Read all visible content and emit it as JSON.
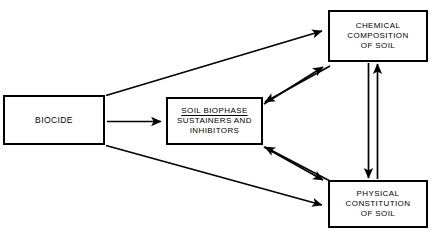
{
  "diagram": {
    "background_color": "#ffffff",
    "line_color": "#000000",
    "nodes": [
      {
        "id": "biocide",
        "label": "BIOCIDE",
        "lines": [
          "BIOCIDE"
        ],
        "underline_first_line": false
      },
      {
        "id": "soil-biophase",
        "label": "SOIL BIOPHASE SUSTAINERS AND INHIBITORS",
        "lines": [
          "SOIL BIOPHASE",
          "SUSTAINERS  AND",
          "INHIBITORS"
        ],
        "underline_first_line": true
      },
      {
        "id": "chemical-composition",
        "label": "CHEMICAL COMPOSITION OF SOIL",
        "lines": [
          "CHEMICAL",
          "COMPOSITION",
          "OF  SOIL"
        ],
        "underline_first_line": false
      },
      {
        "id": "physical-constitution",
        "label": "PHYSICAL CONSTITUTION OF SOIL",
        "lines": [
          "PHYSICAL",
          "CONSTITUTION",
          "OF  SOIL"
        ],
        "underline_first_line": false
      }
    ],
    "connections": [
      {
        "id": "biocide-to-chemical",
        "from": "biocide",
        "to": "chemical-composition",
        "style": "single-arrow"
      },
      {
        "id": "biocide-to-soil-biophase",
        "from": "biocide",
        "to": "soil-biophase",
        "style": "single-arrow"
      },
      {
        "id": "biocide-to-physical",
        "from": "biocide",
        "to": "physical-constitution",
        "style": "single-arrow"
      },
      {
        "id": "soil-biophase-to-chemical",
        "from": "soil-biophase",
        "to": "chemical-composition",
        "style": "single-arrow"
      },
      {
        "id": "chemical-to-soil-biophase",
        "from": "chemical-composition",
        "to": "soil-biophase",
        "style": "single-arrow"
      },
      {
        "id": "soil-biophase-to-physical",
        "from": "soil-biophase",
        "to": "physical-constitution",
        "style": "single-arrow"
      },
      {
        "id": "physical-to-soil-biophase",
        "from": "physical-constitution",
        "to": "soil-biophase",
        "style": "single-arrow"
      },
      {
        "id": "chemical-to-physical",
        "from": "chemical-composition",
        "to": "physical-constitution",
        "style": "single-arrow"
      },
      {
        "id": "physical-to-chemical",
        "from": "physical-constitution",
        "to": "chemical-composition",
        "style": "single-arrow"
      }
    ]
  }
}
